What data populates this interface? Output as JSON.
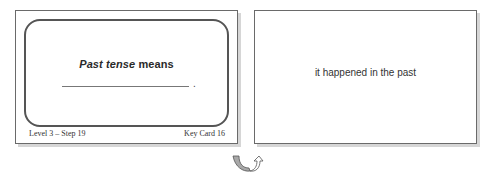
{
  "front_card": {
    "prompt_italic": "Past tense",
    "prompt_rest": " means",
    "blank_end": ".",
    "footer_left": "Level 3 – Step 19",
    "footer_right": "Key Card 16"
  },
  "back_card": {
    "answer": "it happened in the past"
  },
  "icons": {
    "flip": "flip-card-arrow-icon"
  },
  "colors": {
    "border": "#6a6a6a",
    "shadow": "#d6d6d6",
    "text": "#333333"
  }
}
